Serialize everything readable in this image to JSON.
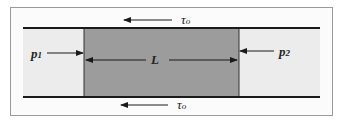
{
  "diagram": {
    "type": "pipe-flow-control-volume",
    "labels": {
      "p1": {
        "base": "p",
        "sub": "1"
      },
      "p2": {
        "base": "p",
        "sub": "2"
      },
      "length": "L",
      "shear_top": {
        "base": "τ",
        "sub": "o"
      },
      "shear_bottom": {
        "base": "τ",
        "sub": "o"
      }
    },
    "colors": {
      "pipe_fluid": "#ececec",
      "control_volume": "#9c9c9c",
      "walls": "#1a1a1a",
      "frame": "#9a9a9a"
    },
    "arrows": {
      "p1": "right",
      "p2": "left",
      "length": "double",
      "shear_top": "left",
      "shear_bottom": "left"
    }
  }
}
